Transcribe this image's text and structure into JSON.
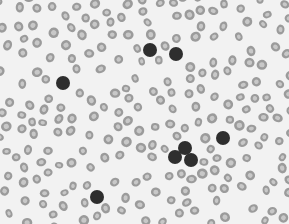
{
  "image": {
    "description": "Grayscale light micrograph of a peripheral blood smear: many pale gray ring-shaped red blood cells with a few darkly stained nucleated cells.",
    "width": 289,
    "height": 224,
    "colors": {
      "background": "#f2f2f2",
      "rbc_rim": "#8c8c8c",
      "rbc_center": "#c8c8c8",
      "dark_cell": "#2e2e2e"
    },
    "dark_cells": [
      {
        "x": 150,
        "y": 50,
        "r": 7
      },
      {
        "x": 176,
        "y": 54,
        "r": 7
      },
      {
        "x": 63,
        "y": 83,
        "r": 7
      },
      {
        "x": 97,
        "y": 197,
        "r": 7
      },
      {
        "x": 223,
        "y": 138,
        "r": 7
      },
      {
        "x": 185,
        "y": 148,
        "r": 7
      },
      {
        "x": 175,
        "y": 157,
        "r": 7
      },
      {
        "x": 191,
        "y": 160,
        "r": 7
      }
    ]
  }
}
